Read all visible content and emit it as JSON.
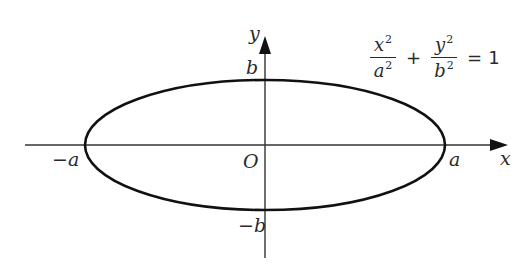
{
  "diagram": {
    "type": "ellipse-on-axes",
    "axes": {
      "x_label": "x",
      "y_label": "y",
      "origin_label": "O"
    },
    "vertices": {
      "right": "a",
      "left": "−a",
      "top": "b",
      "bottom": "−b"
    },
    "equation": {
      "term1_num": "x",
      "term1_den": "a",
      "term2_num": "y",
      "term2_den": "b",
      "exponent": "2",
      "plus": "+",
      "equals": "=",
      "rhs": "1"
    },
    "colors": {
      "curve": "#111111",
      "axis": "#333333",
      "text": "#2a2a2a"
    }
  }
}
